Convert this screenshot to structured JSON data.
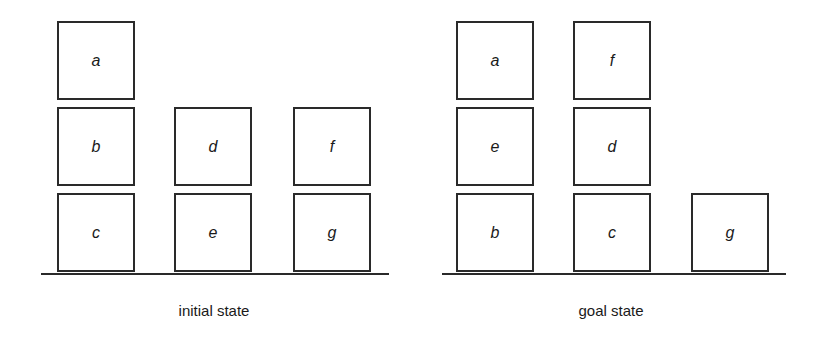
{
  "initial_state": {
    "caption": "initial state",
    "stacks": [
      {
        "blocks_top_to_bottom": [
          "a",
          "b",
          "c"
        ]
      },
      {
        "blocks_top_to_bottom": [
          "d",
          "e"
        ]
      },
      {
        "blocks_top_to_bottom": [
          "f",
          "g"
        ]
      }
    ],
    "blocks": {
      "a": "a",
      "b": "b",
      "c": "c",
      "d": "d",
      "e": "e",
      "f": "f",
      "g": "g"
    }
  },
  "goal_state": {
    "caption": "goal state",
    "stacks": [
      {
        "blocks_top_to_bottom": [
          "a",
          "e",
          "b"
        ]
      },
      {
        "blocks_top_to_bottom": [
          "f",
          "d",
          "c"
        ]
      },
      {
        "blocks_top_to_bottom": [
          "g"
        ]
      }
    ],
    "blocks": {
      "a": "a",
      "e": "e",
      "b": "b",
      "f": "f",
      "d": "d",
      "c": "c",
      "g": "g"
    }
  },
  "colors": {
    "line": "#2a2a2a",
    "background": "#ffffff",
    "text": "#1a1a1a"
  }
}
